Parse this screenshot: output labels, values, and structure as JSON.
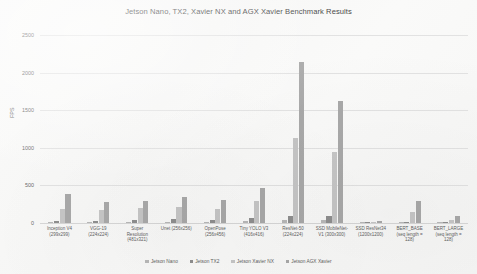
{
  "chart_data": {
    "type": "bar",
    "title": "Jetson Nano, TX2, Xavier NX and AGX Xavier Benchmark Results",
    "xlabel": "",
    "ylabel": "FPS",
    "ylim": [
      0,
      2500
    ],
    "yticks": [
      0,
      500,
      1000,
      1500,
      2000,
      2500
    ],
    "grid": true,
    "legend_position": "bottom",
    "categories": [
      "Inception V4\n(299x299)",
      "VGG-19\n(224x224)",
      "Super\nResolution\n(481x321)",
      "Unet (256x256)",
      "OpenPose\n(256x456)",
      "Tiny YOLO V3\n(416x416)",
      "ResNet-50\n(224x224)",
      "SSD MobileNet-\nV1 (300x300)",
      "SSD ResNet34\n(1200x1200)",
      "BERT_BASE\n(seq length =\n128)",
      "BERT_LARGE\n(seq length =\n128)"
    ],
    "series": [
      {
        "name": "Jetson Nano",
        "color": "#b8b8b8",
        "values": [
          11,
          10,
          15,
          18,
          14,
          25,
          36,
          39,
          1,
          2,
          0.6
        ]
      },
      {
        "name": "Jetson TX2",
        "color": "#8f8f8f",
        "values": [
          33,
          28,
          36,
          47,
          40,
          63,
          90,
          96,
          3,
          6,
          1.7
        ]
      },
      {
        "name": "Jetson Xavier NX",
        "color": "#c6c6c6",
        "values": [
          188,
          172,
          195,
          207,
          182,
          295,
          1129,
          948,
          20,
          152,
          41
        ]
      },
      {
        "name": "Jetson AGX Xavier",
        "color": "#a9a9a9",
        "values": [
          384,
          280,
          295,
          345,
          300,
          470,
          2142,
          1622,
          25,
          290,
          96
        ]
      }
    ]
  }
}
